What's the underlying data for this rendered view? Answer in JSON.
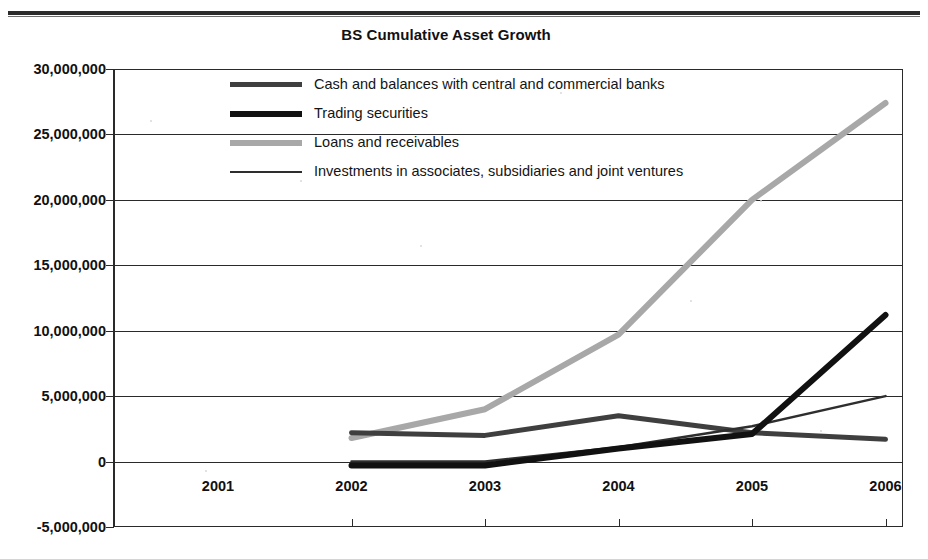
{
  "page": {
    "rule_color": "#2b2b2b"
  },
  "chart": {
    "title": "BS Cumulative Asset Growth"
  },
  "axes": {
    "y_ticks": [
      "30,000,000",
      "25,000,000",
      "20,000,000",
      "15,000,000",
      "10,000,000",
      "5,000,000",
      "0",
      "-5,000,000"
    ],
    "x_ticks": [
      "2001",
      "2002",
      "2003",
      "2004",
      "2005",
      "2006"
    ]
  },
  "legend": {
    "items": [
      {
        "label": "Cash and balances with central and commercial banks",
        "color": "#3f3f3f",
        "width": 5
      },
      {
        "label": "Trading securities",
        "color": "#111111",
        "width": 6
      },
      {
        "label": "Loans and receivables",
        "color": "#a8a8a8",
        "width": 6
      },
      {
        "label": "Investments in associates, subsidiaries and joint ventures",
        "color": "#2e2e2e",
        "width": 2.5
      }
    ]
  },
  "chart_data": {
    "type": "line",
    "title": "BS Cumulative Asset Growth",
    "xlabel": "",
    "ylabel": "",
    "x": [
      "2001",
      "2002",
      "2003",
      "2004",
      "2005",
      "2006"
    ],
    "ylim": [
      -5000000,
      30000000
    ],
    "ytick_step": 5000000,
    "grid": true,
    "legend_position": "inside-top-center",
    "series": [
      {
        "name": "Cash and balances with central and commercial banks",
        "color": "#3f3f3f",
        "width": 5,
        "values": [
          null,
          2200000,
          2000000,
          3500000,
          2200000,
          1700000
        ]
      },
      {
        "name": "Trading securities",
        "color": "#111111",
        "width": 6,
        "values": [
          null,
          -300000,
          -300000,
          1000000,
          2100000,
          11200000
        ]
      },
      {
        "name": "Loans and receivables",
        "color": "#a8a8a8",
        "width": 6,
        "values": [
          null,
          1800000,
          4000000,
          9700000,
          20000000,
          27400000
        ]
      },
      {
        "name": "Investments in associates, subsidiaries and joint ventures",
        "color": "#2e2e2e",
        "width": 2.5,
        "values": [
          null,
          0,
          0,
          1100000,
          2700000,
          5000000
        ]
      }
    ]
  }
}
